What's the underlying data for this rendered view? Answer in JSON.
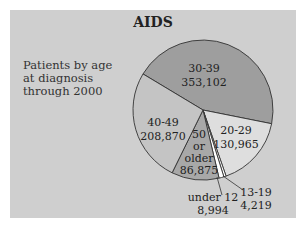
{
  "chart_data": {
    "type": "pie",
    "title": "AIDS",
    "subtitle": "Patients by age at diagnosis through 2000",
    "subtitle_lines": [
      "Patients by age",
      "at diagnosis",
      "through 2000"
    ],
    "categories": [
      "30-39",
      "20-29",
      "13-19",
      "under 12",
      "50 or older",
      "40-49"
    ],
    "values": [
      353102,
      130965,
      4219,
      8994,
      86875,
      208870
    ],
    "value_labels": [
      "353,102",
      "130,965",
      "4,219",
      "8,994",
      "86,875",
      "208,870"
    ],
    "colors": [
      "#9e9e9e",
      "#dedede",
      "#ffffff",
      "#ffffff",
      "#a8a8a8",
      "#c4c4c4"
    ],
    "start_angle_deg": 211,
    "direction": "clockwise",
    "legend": "none (labels on slices)"
  },
  "background_color": "#cfcfcf"
}
